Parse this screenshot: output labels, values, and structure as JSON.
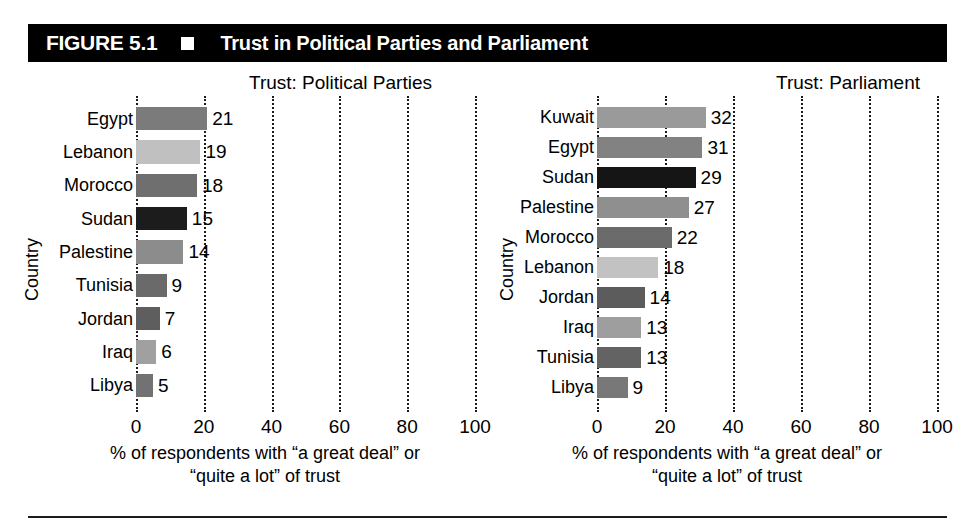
{
  "figure": {
    "number": "FIGURE 5.1",
    "marker": "black-square-bullet",
    "title": "Trust in Political Parties and Parliament"
  },
  "chart_data": [
    {
      "type": "bar",
      "orientation": "horizontal",
      "title": "Trust: Political Parties",
      "xlabel_line1": "% of respondents with “a great deal” or",
      "xlabel_line2": "“quite a lot” of trust",
      "ylabel": "Country",
      "xlim": [
        0,
        100
      ],
      "xticks": [
        0,
        20,
        40,
        60,
        80,
        100
      ],
      "grid": "vertical-dotted",
      "legend": "none",
      "categories": [
        "Egypt",
        "Lebanon",
        "Morocco",
        "Sudan",
        "Palestine",
        "Tunisia",
        "Jordan",
        "Iraq",
        "Libya"
      ],
      "values": [
        21,
        19,
        18,
        15,
        14,
        9,
        7,
        6,
        5
      ],
      "bar_colors": [
        "#7b7b7b",
        "#c0c0c0",
        "#6f6f6f",
        "#1c1c1c",
        "#8c8c8c",
        "#6a6a6a",
        "#5e5e5e",
        "#a0a0a0",
        "#727272"
      ]
    },
    {
      "type": "bar",
      "orientation": "horizontal",
      "title": "Trust: Parliament",
      "xlabel_line1": "% of respondents with “a great deal” or",
      "xlabel_line2": "“quite a lot” of trust",
      "ylabel": "Country",
      "xlim": [
        0,
        100
      ],
      "xticks": [
        0,
        20,
        40,
        60,
        80,
        100
      ],
      "grid": "vertical-dotted",
      "legend": "none",
      "categories": [
        "Kuwait",
        "Egypt",
        "Sudan",
        "Palestine",
        "Morocco",
        "Lebanon",
        "Jordan",
        "Iraq",
        "Tunisia",
        "Libya"
      ],
      "values": [
        32,
        31,
        29,
        27,
        22,
        18,
        14,
        13,
        13,
        9
      ],
      "bar_colors": [
        "#9a9a9a",
        "#828282",
        "#151515",
        "#8f8f8f",
        "#6b6b6b",
        "#c2c2c2",
        "#5c5c5c",
        "#9e9e9e",
        "#636363",
        "#787878"
      ]
    }
  ]
}
